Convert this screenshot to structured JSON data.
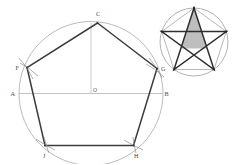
{
  "figure": {
    "colors": {
      "background": "#ffffff",
      "circle_stroke": "#a9a9a9",
      "construction_stroke": "#b4b4b4",
      "polygon_stroke": "#3c3c3c",
      "star_stroke": "#2e2e2e",
      "star_fill": "#b3b3b3",
      "inset_pentagon_stroke": "#9a9a9a",
      "label_color": "#4a4a4a"
    },
    "main": {
      "name": "pentagon-construction",
      "center_label": "O",
      "vertices": [
        {
          "id": "C",
          "label": "C",
          "x": 97.5,
          "y": 23.0,
          "label_x": 96.0,
          "label_y": 15.5
        },
        {
          "id": "G",
          "label": "G",
          "x": 157.0,
          "y": 68.5,
          "label_x": 161.0,
          "label_y": 71.0
        },
        {
          "id": "H",
          "label": "H",
          "x": 133.5,
          "y": 145.5,
          "label_x": 134.0,
          "label_y": 157.5
        },
        {
          "id": "J",
          "label": "J",
          "x": 45.0,
          "y": 145.5,
          "label_x": 43.0,
          "label_y": 157.5
        },
        {
          "id": "F",
          "label": "F",
          "x": 27.0,
          "y": 67.5,
          "label_x": 15.5,
          "label_y": 70.0
        }
      ],
      "diameter_points": [
        {
          "id": "A",
          "label": "A",
          "x": 19.0,
          "y": 93.5,
          "label_x": 10.5,
          "label_y": 96.0
        },
        {
          "id": "B",
          "label": "B",
          "x": 163.0,
          "y": 93.5,
          "label_x": 164.5,
          "label_y": 96.0
        }
      ],
      "center": {
        "id": "O",
        "label": "O",
        "x": 91.0,
        "y": 93.5,
        "label_x": 93.0,
        "label_y": 92.0
      },
      "circle": {
        "cx": 91.0,
        "cy": 93.5,
        "r": 72.0
      },
      "construction_lines": [
        {
          "name": "horizontal-diameter",
          "x1": 19.0,
          "y1": 93.5,
          "x2": 163.0,
          "y2": 93.5
        },
        {
          "name": "vertical-radius",
          "x1": 91.0,
          "y1": 23.0,
          "x2": 91.0,
          "y2": 93.5
        }
      ],
      "arc_marks": [
        {
          "name": "arc-mark-F",
          "cx": 27.0,
          "cy": 67.5
        },
        {
          "name": "arc-mark-G",
          "cx": 157.0,
          "cy": 68.5
        },
        {
          "name": "arc-mark-J",
          "cx": 45.0,
          "cy": 145.5
        },
        {
          "name": "arc-mark-H",
          "cx": 133.5,
          "cy": 145.5
        }
      ]
    },
    "inset": {
      "name": "pentagram-inset",
      "circle": {
        "cx": 194.0,
        "cy": 42.0,
        "r": 34.0
      },
      "pentagon_vertices": [
        {
          "id": "P1",
          "x": 194.0,
          "y": 8.0
        },
        {
          "id": "P2",
          "x": 226.3,
          "y": 31.5
        },
        {
          "id": "P3",
          "x": 214.0,
          "y": 69.5
        },
        {
          "id": "P4",
          "x": 174.0,
          "y": 69.5
        },
        {
          "id": "P5",
          "x": 161.7,
          "y": 31.5
        }
      ],
      "star_order": [
        0,
        2,
        4,
        1,
        3
      ],
      "shaded_triangle": [
        {
          "x": 194.0,
          "y": 8.0
        },
        {
          "x": 207.0,
          "y": 48.5
        },
        {
          "x": 181.0,
          "y": 48.5
        }
      ]
    }
  }
}
